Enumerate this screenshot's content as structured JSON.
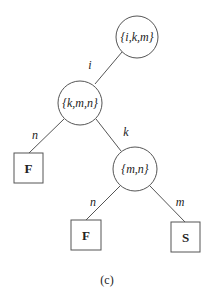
{
  "diagram": {
    "caption": "(c)",
    "nodes": [
      {
        "id": "root",
        "label": "{i,k,m}",
        "shape": "circle"
      },
      {
        "id": "kmn",
        "label": "{k,m,n}",
        "shape": "circle"
      },
      {
        "id": "mn",
        "label": "{m,n}",
        "shape": "circle"
      },
      {
        "id": "leaf1",
        "label": "F",
        "shape": "square"
      },
      {
        "id": "leaf2",
        "label": "F",
        "shape": "square"
      },
      {
        "id": "leaf3",
        "label": "S",
        "shape": "square"
      }
    ],
    "edges": [
      {
        "from": "root",
        "to": "kmn",
        "label": "i"
      },
      {
        "from": "kmn",
        "to": "leaf1",
        "label": "n"
      },
      {
        "from": "kmn",
        "to": "mn",
        "label": "k"
      },
      {
        "from": "mn",
        "to": "leaf2",
        "label": "n"
      },
      {
        "from": "mn",
        "to": "leaf3",
        "label": "m"
      }
    ]
  }
}
